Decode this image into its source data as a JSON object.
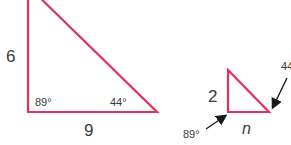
{
  "colors": {
    "triangle_stroke": "#e0335c",
    "text": "#3a3a3a",
    "arrow": "#1a1a1a"
  },
  "large_triangle": {
    "side_vertical": "6",
    "side_horizontal": "9",
    "angle_left": "89°",
    "angle_right": "44°"
  },
  "small_triangle": {
    "side_vertical": "2",
    "side_horizontal": "n",
    "angle_left": "89°",
    "angle_right": "44°"
  }
}
